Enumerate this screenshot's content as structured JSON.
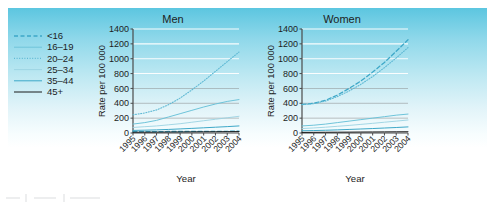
{
  "figure": {
    "background_top_color": "#5cc6e0",
    "background_bottom_color": "#ffffff",
    "axis_color": "#4a4a4a",
    "gridline_color": "#ffffff"
  },
  "legend": {
    "name": "age-group-legend",
    "position": "left",
    "entries": [
      {
        "label": "<16",
        "style": "dashed",
        "color": "#3ea8c8"
      },
      {
        "label": "16–19",
        "style": "solid-light",
        "color": "#6ec4da"
      },
      {
        "label": "20–24",
        "style": "dotted",
        "color": "#5fb9d4"
      },
      {
        "label": "25–34",
        "style": "solid-pale",
        "color": "#9bd3e2"
      },
      {
        "label": "35–44",
        "style": "solid-mid",
        "color": "#3ea8c8"
      },
      {
        "label": "45+",
        "style": "solid-dark",
        "color": "#1a1a1a"
      }
    ]
  },
  "chart_data": [
    {
      "type": "line",
      "title": "Men",
      "xlabel": "Year",
      "ylabel": "Rate per 100 000",
      "x": [
        1995,
        1996,
        1997,
        1998,
        1999,
        2000,
        2001,
        2002,
        2003,
        2004
      ],
      "categories": [
        "1995",
        "1996",
        "1997",
        "1998",
        "1999",
        "2000",
        "2001",
        "2002",
        "2003",
        "2004"
      ],
      "xtick_rotation": -45,
      "ylim": [
        0,
        1400
      ],
      "yticks": [
        0,
        200,
        400,
        600,
        800,
        1000,
        1200,
        1400
      ],
      "grid": true,
      "legend_position": "outside-left",
      "series": [
        {
          "name": "<16",
          "style": "dashed",
          "color": "#3ea8c8",
          "values": [
            18,
            18,
            19,
            20,
            20,
            21,
            22,
            22,
            23,
            24
          ]
        },
        {
          "name": "16–19",
          "style": "solid-light",
          "color": "#6ec4da",
          "values": [
            120,
            140,
            170,
            215,
            260,
            305,
            350,
            390,
            425,
            450
          ]
        },
        {
          "name": "20–24",
          "style": "dotted",
          "color": "#5fb9d4",
          "values": [
            245,
            270,
            310,
            380,
            470,
            580,
            700,
            830,
            960,
            1090
          ]
        },
        {
          "name": "25–34",
          "style": "solid-pale",
          "color": "#9bd3e2",
          "values": [
            75,
            85,
            95,
            110,
            125,
            145,
            165,
            185,
            205,
            225
          ]
        },
        {
          "name": "35–44",
          "style": "solid-mid",
          "color": "#3ea8c8",
          "values": [
            35,
            38,
            42,
            48,
            55,
            62,
            70,
            78,
            86,
            95
          ]
        },
        {
          "name": "45+",
          "style": "solid-dark",
          "color": "#1a1a1a",
          "values": [
            10,
            11,
            12,
            13,
            14,
            15,
            16,
            17,
            18,
            19
          ]
        }
      ]
    },
    {
      "type": "line",
      "title": "Women",
      "xlabel": "Year",
      "ylabel": "Rate per 100 000",
      "x": [
        1995,
        1996,
        1997,
        1998,
        1999,
        2000,
        2001,
        2002,
        2003,
        2004
      ],
      "categories": [
        "1995",
        "1996",
        "1997",
        "1998",
        "1999",
        "2000",
        "2001",
        "2002",
        "2003",
        "2004"
      ],
      "xtick_rotation": -45,
      "ylim": [
        0,
        1400
      ],
      "yticks": [
        0,
        200,
        400,
        600,
        800,
        1000,
        1200,
        1400
      ],
      "grid": true,
      "legend_position": "outside-left",
      "series": [
        {
          "name": "<16",
          "style": "dashed",
          "color": "#3ea8c8",
          "values": [
            385,
            400,
            440,
            510,
            600,
            700,
            820,
            950,
            1100,
            1255
          ]
        },
        {
          "name": "16–19",
          "style": "solid-light",
          "color": "#6ec4da",
          "values": [
            95,
            105,
            120,
            140,
            160,
            180,
            200,
            220,
            240,
            255
          ]
        },
        {
          "name": "20–24",
          "style": "dotted",
          "color": "#5fb9d4",
          "values": [
            380,
            395,
            430,
            490,
            565,
            655,
            760,
            880,
            1010,
            1150
          ]
        },
        {
          "name": "25–34",
          "style": "solid-pale",
          "color": "#9bd3e2",
          "values": [
            60,
            68,
            78,
            90,
            102,
            116,
            130,
            145,
            160,
            175
          ]
        },
        {
          "name": "35–44",
          "style": "solid-mid",
          "color": "#3ea8c8",
          "values": [
            30,
            33,
            37,
            42,
            48,
            54,
            60,
            67,
            74,
            82
          ]
        },
        {
          "name": "45+",
          "style": "solid-dark",
          "color": "#1a1a1a",
          "values": [
            8,
            9,
            10,
            11,
            12,
            13,
            14,
            15,
            16,
            17
          ]
        }
      ]
    }
  ]
}
